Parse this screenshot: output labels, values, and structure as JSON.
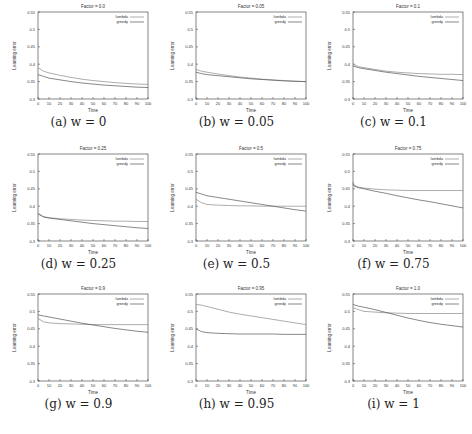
{
  "chart_data": [
    {
      "type": "line",
      "id": "a",
      "title": "Factor = 0.0",
      "caption": "(a) w = 0",
      "xlabel": "Time",
      "ylabel": "Learning error",
      "xlim": [
        0,
        100
      ],
      "ylim": [
        0.3,
        0.55
      ],
      "x": [
        0,
        5,
        10,
        20,
        30,
        40,
        50,
        60,
        70,
        80,
        90,
        100
      ],
      "series": [
        {
          "name": "lambda",
          "values": [
            0.39,
            0.38,
            0.375,
            0.368,
            0.362,
            0.357,
            0.353,
            0.35,
            0.347,
            0.345,
            0.343,
            0.342
          ]
        },
        {
          "name": "greedy",
          "values": [
            0.37,
            0.365,
            0.36,
            0.355,
            0.35,
            0.346,
            0.343,
            0.34,
            0.338,
            0.336,
            0.334,
            0.333
          ]
        }
      ]
    },
    {
      "type": "line",
      "id": "b",
      "title": "Factor = 0.05",
      "caption": "(b) w = 0.05",
      "xlabel": "Time",
      "ylabel": "Learning error",
      "xlim": [
        0,
        100
      ],
      "ylim": [
        0.3,
        0.55
      ],
      "x": [
        0,
        5,
        10,
        20,
        30,
        40,
        50,
        60,
        70,
        80,
        90,
        100
      ],
      "series": [
        {
          "name": "lambda",
          "values": [
            0.385,
            0.38,
            0.377,
            0.372,
            0.367,
            0.363,
            0.36,
            0.357,
            0.355,
            0.353,
            0.351,
            0.35
          ]
        },
        {
          "name": "greedy",
          "values": [
            0.377,
            0.373,
            0.37,
            0.367,
            0.364,
            0.361,
            0.358,
            0.356,
            0.354,
            0.352,
            0.351,
            0.35
          ]
        }
      ]
    },
    {
      "type": "line",
      "id": "c",
      "title": "Factor = 0.1",
      "caption": "(c) w = 0.1",
      "xlabel": "Time",
      "ylabel": "Learning error",
      "xlim": [
        0,
        100
      ],
      "ylim": [
        0.3,
        0.55
      ],
      "x": [
        0,
        5,
        10,
        20,
        30,
        40,
        50,
        60,
        70,
        80,
        90,
        100
      ],
      "series": [
        {
          "name": "lambda",
          "values": [
            0.4,
            0.393,
            0.39,
            0.385,
            0.38,
            0.377,
            0.375,
            0.373,
            0.372,
            0.371,
            0.371,
            0.37
          ]
        },
        {
          "name": "greedy",
          "values": [
            0.395,
            0.39,
            0.387,
            0.382,
            0.377,
            0.373,
            0.369,
            0.365,
            0.362,
            0.359,
            0.356,
            0.353
          ]
        }
      ]
    },
    {
      "type": "line",
      "id": "d",
      "title": "Factor = 0.25",
      "caption": "(d) w = 0.25",
      "xlabel": "Time",
      "ylabel": "Learning error",
      "xlim": [
        0,
        100
      ],
      "ylim": [
        0.3,
        0.55
      ],
      "x": [
        0,
        5,
        10,
        20,
        30,
        40,
        50,
        60,
        70,
        80,
        90,
        100
      ],
      "series": [
        {
          "name": "lambda",
          "values": [
            0.38,
            0.37,
            0.367,
            0.364,
            0.362,
            0.36,
            0.359,
            0.358,
            0.357,
            0.357,
            0.356,
            0.356
          ]
        },
        {
          "name": "greedy",
          "values": [
            0.378,
            0.369,
            0.366,
            0.362,
            0.358,
            0.354,
            0.35,
            0.347,
            0.344,
            0.341,
            0.338,
            0.336
          ]
        }
      ]
    },
    {
      "type": "line",
      "id": "e",
      "title": "Factor = 0.5",
      "caption": "(e) w = 0.5",
      "xlabel": "Time",
      "ylabel": "Learning error",
      "xlim": [
        0,
        100
      ],
      "ylim": [
        0.3,
        0.55
      ],
      "x": [
        0,
        5,
        10,
        20,
        30,
        40,
        50,
        60,
        70,
        80,
        90,
        100
      ],
      "series": [
        {
          "name": "lambda",
          "values": [
            0.42,
            0.41,
            0.405,
            0.403,
            0.402,
            0.401,
            0.401,
            0.4,
            0.4,
            0.4,
            0.4,
            0.4
          ]
        },
        {
          "name": "greedy",
          "values": [
            0.44,
            0.435,
            0.43,
            0.425,
            0.42,
            0.415,
            0.41,
            0.405,
            0.4,
            0.395,
            0.39,
            0.386
          ]
        }
      ]
    },
    {
      "type": "line",
      "id": "f",
      "title": "Factor = 0.75",
      "caption": "(f) w = 0.75",
      "xlabel": "Time",
      "ylabel": "Learning error",
      "xlim": [
        0,
        100
      ],
      "ylim": [
        0.3,
        0.55
      ],
      "x": [
        0,
        1,
        5,
        10,
        20,
        30,
        40,
        50,
        60,
        70,
        80,
        90,
        100
      ],
      "series": [
        {
          "name": "lambda",
          "values": [
            0.47,
            0.46,
            0.455,
            0.452,
            0.449,
            0.447,
            0.446,
            0.445,
            0.445,
            0.445,
            0.445,
            0.445,
            0.445
          ]
        },
        {
          "name": "greedy",
          "values": [
            0.465,
            0.458,
            0.453,
            0.45,
            0.443,
            0.437,
            0.43,
            0.424,
            0.418,
            0.413,
            0.407,
            0.401,
            0.395
          ]
        }
      ]
    },
    {
      "type": "line",
      "id": "g",
      "title": "Factor = 0.9",
      "caption": "(g) w = 0.9",
      "xlabel": "Time",
      "ylabel": "Learning error",
      "xlim": [
        0,
        100
      ],
      "ylim": [
        0.3,
        0.55
      ],
      "x": [
        0,
        5,
        10,
        20,
        30,
        40,
        50,
        60,
        70,
        80,
        90,
        100
      ],
      "series": [
        {
          "name": "lambda",
          "values": [
            0.48,
            0.47,
            0.467,
            0.465,
            0.464,
            0.463,
            0.462,
            0.462,
            0.462,
            0.462,
            0.462,
            0.462
          ]
        },
        {
          "name": "greedy",
          "values": [
            0.49,
            0.487,
            0.484,
            0.478,
            0.472,
            0.466,
            0.461,
            0.456,
            0.451,
            0.447,
            0.443,
            0.44
          ]
        }
      ]
    },
    {
      "type": "line",
      "id": "h",
      "title": "Factor = 0.95",
      "caption": "(h) w = 0.95",
      "xlabel": "Time",
      "ylabel": "Learning error",
      "xlim": [
        0,
        100
      ],
      "ylim": [
        0.3,
        0.55
      ],
      "x": [
        0,
        5,
        10,
        20,
        30,
        40,
        50,
        60,
        70,
        80,
        90,
        100
      ],
      "series": [
        {
          "name": "lambda",
          "values": [
            0.52,
            0.518,
            0.514,
            0.506,
            0.498,
            0.492,
            0.487,
            0.482,
            0.477,
            0.472,
            0.467,
            0.462
          ]
        },
        {
          "name": "greedy",
          "values": [
            0.45,
            0.442,
            0.439,
            0.437,
            0.436,
            0.435,
            0.435,
            0.435,
            0.435,
            0.434,
            0.434,
            0.434
          ]
        }
      ]
    },
    {
      "type": "line",
      "id": "i",
      "title": "Factor = 1.0",
      "caption": "(i) w = 1",
      "xlabel": "Time",
      "ylabel": "Learning error",
      "xlim": [
        0,
        100
      ],
      "ylim": [
        0.3,
        0.55
      ],
      "x": [
        0,
        5,
        10,
        20,
        30,
        40,
        50,
        60,
        70,
        80,
        90,
        100
      ],
      "series": [
        {
          "name": "lambda",
          "values": [
            0.51,
            0.505,
            0.5,
            0.498,
            0.496,
            0.495,
            0.494,
            0.494,
            0.494,
            0.494,
            0.494,
            0.494
          ]
        },
        {
          "name": "greedy",
          "values": [
            0.52,
            0.515,
            0.512,
            0.505,
            0.497,
            0.489,
            0.481,
            0.474,
            0.468,
            0.463,
            0.459,
            0.455
          ]
        }
      ]
    }
  ],
  "axes": {
    "xticks": [
      0,
      10,
      20,
      30,
      40,
      50,
      60,
      70,
      80,
      90,
      100
    ],
    "yticks": [
      0.3,
      0.35,
      0.4,
      0.45,
      0.5,
      0.55
    ],
    "ytick_labels": [
      "0.3",
      "0.35",
      "0.4",
      "0.45",
      "0.5",
      "0.55"
    ]
  },
  "legend": {
    "entries": [
      "lambda",
      "greedy"
    ],
    "position": "top-right"
  },
  "colors": {
    "lambda": "#8a8a8a",
    "greedy": "#555555",
    "axis": "#333333"
  }
}
